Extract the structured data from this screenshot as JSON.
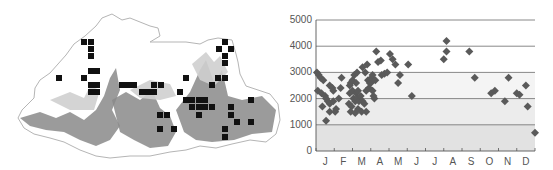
{
  "map": {
    "label": "Bhutan sampling locations map",
    "marker_color": "#111111",
    "relief_dark": "#8a8a8a",
    "relief_light": "#cfcfcf",
    "border_color": "#b5b5b5",
    "markers": [
      [
        84,
        42
      ],
      [
        91,
        42
      ],
      [
        91,
        49
      ],
      [
        91,
        56
      ],
      [
        91,
        71
      ],
      [
        97,
        71
      ],
      [
        59,
        78
      ],
      [
        84,
        78
      ],
      [
        91,
        85
      ],
      [
        97,
        85
      ],
      [
        91,
        92
      ],
      [
        97,
        92
      ],
      [
        122,
        85
      ],
      [
        128,
        85
      ],
      [
        134,
        85
      ],
      [
        142,
        92
      ],
      [
        148,
        92
      ],
      [
        154,
        92
      ],
      [
        154,
        85
      ],
      [
        161,
        85
      ],
      [
        180,
        92
      ],
      [
        160,
        115
      ],
      [
        167,
        115
      ],
      [
        160,
        129
      ],
      [
        174,
        129
      ],
      [
        186,
        78
      ],
      [
        180,
        92
      ],
      [
        212,
        85
      ],
      [
        218,
        78
      ],
      [
        225,
        42
      ],
      [
        219,
        49
      ],
      [
        231,
        49
      ],
      [
        225,
        56
      ],
      [
        225,
        63
      ],
      [
        225,
        78
      ],
      [
        186,
        100
      ],
      [
        192,
        100
      ],
      [
        199,
        100
      ],
      [
        205,
        100
      ],
      [
        192,
        107
      ],
      [
        199,
        107
      ],
      [
        205,
        107
      ],
      [
        212,
        107
      ],
      [
        199,
        115
      ],
      [
        231,
        107
      ],
      [
        231,
        115
      ],
      [
        237,
        122
      ],
      [
        251,
        100
      ],
      [
        251,
        122
      ],
      [
        225,
        129
      ],
      [
        225,
        137
      ]
    ]
  },
  "chart_data": {
    "type": "scatter",
    "title": "",
    "xlabel": "",
    "ylabel": "",
    "ylim": [
      0,
      5000
    ],
    "yticks": [
      "0",
      "1000",
      "2000",
      "3000",
      "4000",
      "5000"
    ],
    "xticks": [
      "J",
      "F",
      "M",
      "A",
      "M",
      "J",
      "J",
      "A",
      "S",
      "O",
      "N",
      "D"
    ],
    "grid": true,
    "legend": "none",
    "marker": "diamond",
    "marker_color": "#5a5a5a",
    "band_colors": [
      "#e2e2e2",
      "#ececec",
      "#f4f4f4",
      "#ffffff",
      "#ffffff"
    ],
    "series": [
      {
        "name": "observations",
        "points": [
          {
            "x": 0.05,
            "y": 3000
          },
          {
            "x": 0.15,
            "y": 2900
          },
          {
            "x": 0.25,
            "y": 2800
          },
          {
            "x": 0.4,
            "y": 2700
          },
          {
            "x": 0.1,
            "y": 2300
          },
          {
            "x": 0.3,
            "y": 2200
          },
          {
            "x": 0.5,
            "y": 2100
          },
          {
            "x": 0.35,
            "y": 1700
          },
          {
            "x": 0.65,
            "y": 1900
          },
          {
            "x": 0.75,
            "y": 1800
          },
          {
            "x": 0.55,
            "y": 2000
          },
          {
            "x": 0.75,
            "y": 2500
          },
          {
            "x": 0.9,
            "y": 2400
          },
          {
            "x": 0.95,
            "y": 2300
          },
          {
            "x": 0.55,
            "y": 1150
          },
          {
            "x": 0.75,
            "y": 1500
          },
          {
            "x": 0.95,
            "y": 1900
          },
          {
            "x": 1.05,
            "y": 1500
          },
          {
            "x": 1.1,
            "y": 1600
          },
          {
            "x": 1.25,
            "y": 2000
          },
          {
            "x": 1.35,
            "y": 2400
          },
          {
            "x": 1.4,
            "y": 2800
          },
          {
            "x": 1.85,
            "y": 2500
          },
          {
            "x": 1.9,
            "y": 2600
          },
          {
            "x": 2.0,
            "y": 2700
          },
          {
            "x": 2.1,
            "y": 2900
          },
          {
            "x": 1.85,
            "y": 2200
          },
          {
            "x": 2.0,
            "y": 2300
          },
          {
            "x": 2.2,
            "y": 2200
          },
          {
            "x": 2.3,
            "y": 2300
          },
          {
            "x": 1.8,
            "y": 1800
          },
          {
            "x": 1.95,
            "y": 1700
          },
          {
            "x": 2.05,
            "y": 2000
          },
          {
            "x": 2.15,
            "y": 1900
          },
          {
            "x": 2.25,
            "y": 2000
          },
          {
            "x": 2.35,
            "y": 1900
          },
          {
            "x": 1.9,
            "y": 1500
          },
          {
            "x": 2.15,
            "y": 1450
          },
          {
            "x": 2.3,
            "y": 1600
          },
          {
            "x": 2.2,
            "y": 2600
          },
          {
            "x": 2.25,
            "y": 3000
          },
          {
            "x": 2.45,
            "y": 2100
          },
          {
            "x": 2.55,
            "y": 1900
          },
          {
            "x": 2.65,
            "y": 1800
          },
          {
            "x": 2.75,
            "y": 1500
          },
          {
            "x": 2.5,
            "y": 1500
          },
          {
            "x": 2.55,
            "y": 3200
          },
          {
            "x": 2.7,
            "y": 3000
          },
          {
            "x": 2.8,
            "y": 3300
          },
          {
            "x": 2.75,
            "y": 2300
          },
          {
            "x": 2.85,
            "y": 2700
          },
          {
            "x": 2.95,
            "y": 2600
          },
          {
            "x": 3.0,
            "y": 2600
          },
          {
            "x": 3.05,
            "y": 2800
          },
          {
            "x": 3.1,
            "y": 2300
          },
          {
            "x": 3.15,
            "y": 2100
          },
          {
            "x": 3.2,
            "y": 2000
          },
          {
            "x": 2.9,
            "y": 2400
          },
          {
            "x": 3.1,
            "y": 2900
          },
          {
            "x": 3.25,
            "y": 2700
          },
          {
            "x": 3.3,
            "y": 3800
          },
          {
            "x": 3.4,
            "y": 3400
          },
          {
            "x": 3.55,
            "y": 3450
          },
          {
            "x": 3.6,
            "y": 2900
          },
          {
            "x": 3.75,
            "y": 2950
          },
          {
            "x": 3.9,
            "y": 3000
          },
          {
            "x": 4.05,
            "y": 3700
          },
          {
            "x": 4.2,
            "y": 3500
          },
          {
            "x": 4.35,
            "y": 3300
          },
          {
            "x": 4.5,
            "y": 2600
          },
          {
            "x": 4.6,
            "y": 2900
          },
          {
            "x": 5.05,
            "y": 3300
          },
          {
            "x": 5.25,
            "y": 2100
          },
          {
            "x": 7.0,
            "y": 3500
          },
          {
            "x": 7.15,
            "y": 3800
          },
          {
            "x": 7.15,
            "y": 4200
          },
          {
            "x": 8.4,
            "y": 3800
          },
          {
            "x": 8.7,
            "y": 2800
          },
          {
            "x": 9.6,
            "y": 2200
          },
          {
            "x": 9.8,
            "y": 2300
          },
          {
            "x": 10.35,
            "y": 1900
          },
          {
            "x": 10.55,
            "y": 2800
          },
          {
            "x": 11.0,
            "y": 2200
          },
          {
            "x": 11.15,
            "y": 2150
          },
          {
            "x": 11.5,
            "y": 2500
          },
          {
            "x": 11.6,
            "y": 1700
          },
          {
            "x": 12.0,
            "y": 700
          }
        ]
      }
    ]
  }
}
